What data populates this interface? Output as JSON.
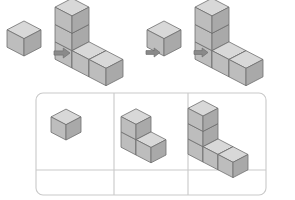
{
  "page": {
    "background_color": "#ffffff",
    "width": 295,
    "height": 200
  },
  "palette": {
    "cube_top": "#d8d8d8",
    "cube_left": "#bdbdbd",
    "cube_right": "#a9a9a9",
    "cube_outline": "#6e6e6e",
    "arrow_fill": "#8a8a8a",
    "arrow_outline": "#6e6e6e",
    "table_border": "#c9c9c9",
    "table_background": "#ffffff"
  },
  "sequence": {
    "name": "build-sequence-strip",
    "cube_size": 17,
    "steps": [
      {
        "id": "step-1",
        "label": "1 cube",
        "cube_count": 1,
        "origin": {
          "x": 24,
          "y": 56
        },
        "cells": [
          {
            "c": 0,
            "r": 0,
            "h": 0
          }
        ]
      },
      {
        "id": "step-2",
        "label": "L-shape with 5 cubes",
        "cube_count": 5,
        "origin": {
          "x": 72,
          "y": 68
        },
        "cells": [
          {
            "c": 0,
            "r": 0,
            "h": 0
          },
          {
            "c": 0,
            "r": 0,
            "h": 1
          },
          {
            "c": 0,
            "r": 0,
            "h": 2
          },
          {
            "c": 1,
            "r": 0,
            "h": 0
          },
          {
            "c": 2,
            "r": 0,
            "h": 0
          }
        ]
      },
      {
        "id": "step-3",
        "label": "1 cube",
        "cube_count": 1,
        "origin": {
          "x": 164,
          "y": 56
        },
        "cells": [
          {
            "c": 0,
            "r": 0,
            "h": 0
          }
        ]
      },
      {
        "id": "step-4",
        "label": "L-shape with 5 cubes",
        "cube_count": 5,
        "origin": {
          "x": 212,
          "y": 68
        },
        "cells": [
          {
            "c": 0,
            "r": 0,
            "h": 0
          },
          {
            "c": 0,
            "r": 0,
            "h": 1
          },
          {
            "c": 0,
            "r": 0,
            "h": 2
          },
          {
            "c": 1,
            "r": 0,
            "h": 0
          },
          {
            "c": 2,
            "r": 0,
            "h": 0
          }
        ]
      }
    ],
    "arrows": [
      {
        "id": "arrow-1",
        "label": "leads to",
        "x": 54,
        "y": 48,
        "w": 16,
        "h": 10
      },
      {
        "id": "arrow-2",
        "label": "leads to",
        "x": 146,
        "y": 48,
        "w": 14,
        "h": 9
      },
      {
        "id": "arrow-3",
        "label": "leads to",
        "x": 194,
        "y": 48,
        "w": 14,
        "h": 9
      }
    ]
  },
  "answer_table": {
    "name": "answer-table",
    "x": 36,
    "y": 93,
    "width": 230,
    "height": 102,
    "corner_radius": 7,
    "columns": 3,
    "rows": 2,
    "column_dividers": [
      114,
      188
    ],
    "row_divider": 170,
    "cells": [
      {
        "id": "cell-r1c1",
        "row": 1,
        "col": 1,
        "label": "1 cube figure",
        "cube_count": 1,
        "origin": {
          "x": 66,
          "y": 140
        },
        "cube_size": 15,
        "cells": [
          {
            "c": 0,
            "r": 0,
            "h": 0
          }
        ]
      },
      {
        "id": "cell-r1c2",
        "row": 1,
        "col": 2,
        "label": "3 cube L figure",
        "cube_count": 3,
        "origin": {
          "x": 136,
          "y": 155
        },
        "cube_size": 15,
        "cells": [
          {
            "c": 0,
            "r": 0,
            "h": 0
          },
          {
            "c": 0,
            "r": 0,
            "h": 1
          },
          {
            "c": 1,
            "r": 0,
            "h": 0
          }
        ]
      },
      {
        "id": "cell-r1c3",
        "row": 1,
        "col": 3,
        "label": "5 cube L figure",
        "cube_count": 5,
        "origin": {
          "x": 203,
          "y": 162
        },
        "cube_size": 15,
        "cells": [
          {
            "c": 0,
            "r": 0,
            "h": 0
          },
          {
            "c": 0,
            "r": 0,
            "h": 1
          },
          {
            "c": 0,
            "r": 0,
            "h": 2
          },
          {
            "c": 1,
            "r": 0,
            "h": 0
          },
          {
            "c": 2,
            "r": 0,
            "h": 0
          }
        ]
      },
      {
        "id": "cell-r2c1",
        "row": 2,
        "col": 1,
        "label": "empty answer box",
        "cube_count": 0,
        "cells": []
      },
      {
        "id": "cell-r2c2",
        "row": 2,
        "col": 2,
        "label": "empty answer box",
        "cube_count": 0,
        "cells": []
      },
      {
        "id": "cell-r2c3",
        "row": 2,
        "col": 3,
        "label": "empty answer box",
        "cube_count": 0,
        "cells": []
      }
    ]
  }
}
